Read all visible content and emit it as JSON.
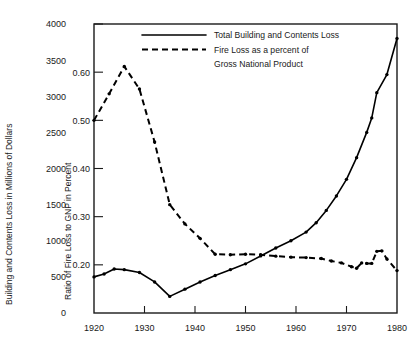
{
  "chart_data": {
    "type": "line",
    "title": "",
    "xlabel": "",
    "ylabel": "Building and Contents Loss in Millions of Dollars",
    "ylabel_right": "Ratio of Fire Loss to GNP in Percent",
    "xlim": [
      1920,
      1980
    ],
    "ylim": [
      0,
      4000
    ],
    "ylim_right": [
      0.1,
      0.7
    ],
    "grid": false,
    "legend_position": "top-center",
    "x_ticks": [
      1920,
      1930,
      1940,
      1950,
      1960,
      1970,
      1980
    ],
    "x_tick_labels": [
      "1920",
      "1930",
      "1940",
      "1950",
      "1960",
      "1970",
      "1980"
    ],
    "y_ticks": [
      0,
      500,
      1000,
      1500,
      2000,
      2500,
      3000,
      3500,
      4000
    ],
    "y_tick_labels": [
      "0",
      "500",
      "1000",
      "1500",
      "2000",
      "2500",
      "3000",
      "3500",
      "4000"
    ],
    "y_ticks_right": [
      0.2,
      0.3,
      0.4,
      0.5,
      0.6,
      0.7
    ],
    "y_tick_labels_right": [
      "0.20",
      "0.30",
      "0.40",
      "0.50",
      "0.60",
      ""
    ],
    "series": [
      {
        "name": "Total Building and Contents Loss",
        "style": "solid",
        "axis": "left",
        "units": "Millions of Dollars",
        "x": [
          1920,
          1922,
          1924,
          1926,
          1929,
          1932,
          1935,
          1938,
          1941,
          1944,
          1947,
          1950,
          1953,
          1956,
          1959,
          1962,
          1964,
          1966,
          1968,
          1970,
          1972,
          1974,
          1975,
          1976,
          1978,
          1980
        ],
        "values": [
          500,
          540,
          610,
          600,
          560,
          430,
          230,
          330,
          430,
          520,
          600,
          680,
          790,
          900,
          1000,
          1120,
          1250,
          1420,
          1620,
          1850,
          2150,
          2500,
          2700,
          3050,
          3300,
          3800
        ]
      },
      {
        "name": "Fire Loss as a percent of Gross National Product",
        "style": "dashed",
        "axis": "right",
        "units": "Percent",
        "x": [
          1920,
          1923,
          1926,
          1929,
          1932,
          1935,
          1938,
          1941,
          1944,
          1947,
          1950,
          1953,
          1956,
          1959,
          1962,
          1965,
          1967,
          1969,
          1971,
          1972,
          1973,
          1974,
          1975,
          1976,
          1977,
          1978,
          1980
        ],
        "values": [
          0.5,
          0.555,
          0.612,
          0.565,
          0.455,
          0.325,
          0.285,
          0.255,
          0.222,
          0.221,
          0.222,
          0.221,
          0.218,
          0.216,
          0.215,
          0.213,
          0.208,
          0.204,
          0.196,
          0.193,
          0.204,
          0.203,
          0.203,
          0.228,
          0.229,
          0.212,
          0.188
        ]
      }
    ],
    "legend": [
      {
        "label": "Total Building and Contents Loss",
        "style": "solid"
      },
      {
        "label": "Fire Loss as a percent of",
        "style": "dashed"
      },
      {
        "label": "Gross National Product",
        "style": "none"
      }
    ]
  }
}
